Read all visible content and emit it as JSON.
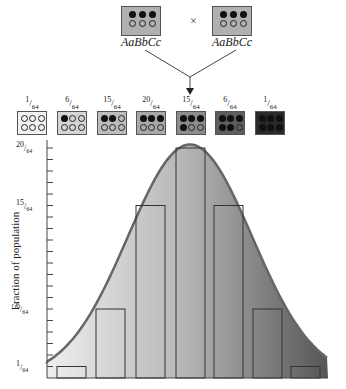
{
  "cross": {
    "parent1": {
      "genotype": "AaBbCc",
      "dots": [
        1,
        1,
        1,
        0,
        0,
        0
      ]
    },
    "parent2": {
      "genotype": "AaBbCc",
      "dots": [
        1,
        1,
        1,
        0,
        0,
        0
      ]
    },
    "symbol": "×"
  },
  "phenotypes": [
    {
      "num": "1",
      "den": "64",
      "fill": "#f2f2f2",
      "dots": [
        0,
        0,
        0,
        0,
        0,
        0
      ]
    },
    {
      "num": "6",
      "den": "64",
      "fill": "#d4d4d4",
      "dots": [
        1,
        0,
        0,
        0,
        0,
        0
      ]
    },
    {
      "num": "15",
      "den": "64",
      "fill": "#bcbcbc",
      "dots": [
        1,
        1,
        0,
        0,
        0,
        0
      ]
    },
    {
      "num": "20",
      "den": "64",
      "fill": "#a8a8a8",
      "dots": [
        1,
        1,
        1,
        0,
        0,
        0
      ]
    },
    {
      "num": "15",
      "den": "64",
      "fill": "#8c8c8c",
      "dots": [
        1,
        1,
        1,
        1,
        0,
        0
      ]
    },
    {
      "num": "6",
      "den": "64",
      "fill": "#5e5e5e",
      "dots": [
        1,
        1,
        1,
        1,
        1,
        0
      ]
    },
    {
      "num": "1",
      "den": "64",
      "fill": "#2a2a2a",
      "dots": [
        1,
        1,
        1,
        1,
        1,
        1
      ]
    }
  ],
  "chart_data": {
    "type": "bar",
    "title": "",
    "xlabel": "",
    "ylabel": "Fraction of population",
    "categories": [
      "0 dominant",
      "1 dominant",
      "2 dominant",
      "3 dominant",
      "4 dominant",
      "5 dominant",
      "6 dominant"
    ],
    "values": [
      1,
      6,
      15,
      20,
      15,
      6,
      1
    ],
    "value_unit": "/64",
    "ylim": [
      0,
      20
    ],
    "yticks_labeled": [
      "1/64",
      "6/64",
      "15/64",
      "20/64"
    ],
    "overlay": "normal distribution curve",
    "grid": false
  },
  "axis": {
    "title": "Fraction of population",
    "labels": [
      {
        "num": "20",
        "den": "64",
        "value": 20
      },
      {
        "num": "15",
        "den": "64",
        "value": 15
      },
      {
        "num": "6",
        "den": "64",
        "value": 6
      },
      {
        "num": "1",
        "den": "64",
        "value": 1
      }
    ]
  }
}
